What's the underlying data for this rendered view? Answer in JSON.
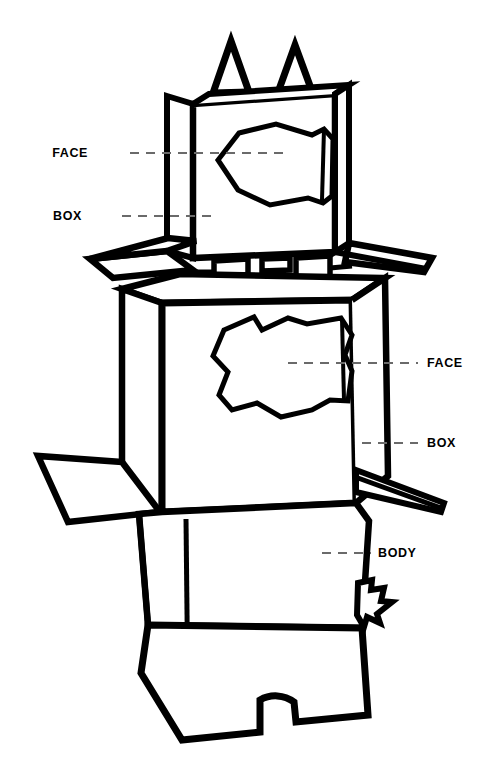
{
  "diagram": {
    "stroke_color": "#000000",
    "background_color": "#ffffff",
    "leader_line_color": "#6a6a6a",
    "labels": [
      {
        "id": "head-face",
        "text": "FACE",
        "side": "left",
        "x": 88,
        "y": 147,
        "leader_x1": 130,
        "leader_x2": 290,
        "leader_y": 153
      },
      {
        "id": "head-box",
        "text": "BOX",
        "side": "left",
        "x": 82,
        "y": 210,
        "leader_x1": 122,
        "leader_x2": 214,
        "leader_y": 216
      },
      {
        "id": "body-face",
        "text": "FACE",
        "side": "right",
        "x": 427,
        "y": 357,
        "leader_x1": 288,
        "leader_x2": 418,
        "leader_y": 363
      },
      {
        "id": "body-box",
        "text": "BOX",
        "side": "right",
        "x": 427,
        "y": 437,
        "leader_x1": 362,
        "leader_x2": 418,
        "leader_y": 443
      },
      {
        "id": "body-body",
        "text": "BODY",
        "side": "right",
        "x": 378,
        "y": 547,
        "leader_x1": 322,
        "leader_x2": 371,
        "leader_y": 553
      }
    ],
    "parts": [
      {
        "id": "head-ears",
        "name": "triangular ear flaps"
      },
      {
        "id": "head-box",
        "name": "head box"
      },
      {
        "id": "head-face-hole",
        "name": "head face cut-out"
      },
      {
        "id": "head-flaps",
        "name": "head side flaps"
      },
      {
        "id": "neck-tabs",
        "name": "neck tabs"
      },
      {
        "id": "body-box",
        "name": "body box"
      },
      {
        "id": "body-face-hole",
        "name": "body face cut-out"
      },
      {
        "id": "left-arm",
        "name": "left arm flap"
      },
      {
        "id": "right-arm",
        "name": "right arm flap"
      },
      {
        "id": "right-hand",
        "name": "jagged hand"
      },
      {
        "id": "legs",
        "name": "legs with arch cut-out"
      }
    ]
  }
}
